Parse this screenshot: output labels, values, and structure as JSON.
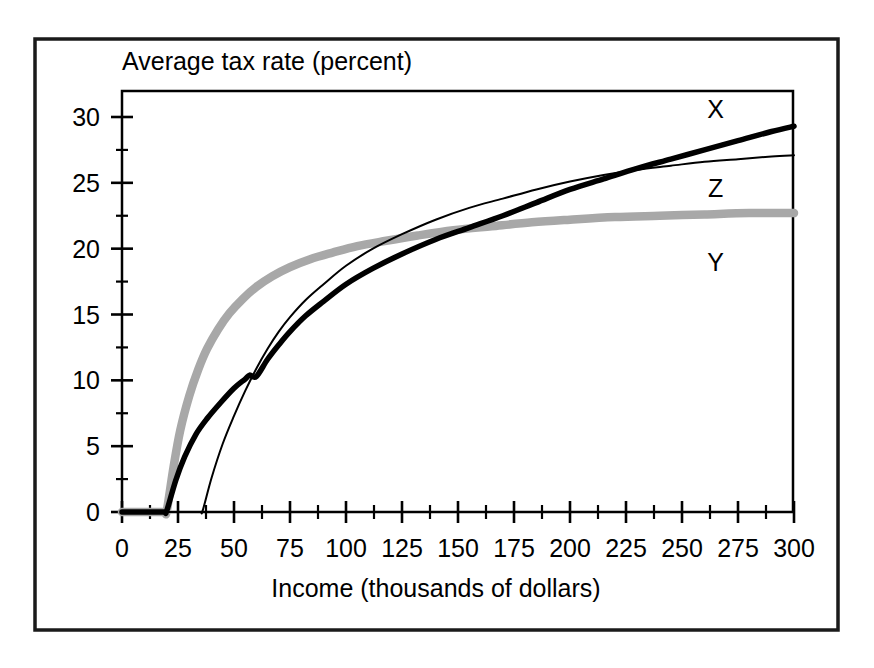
{
  "figure": {
    "frame_color": "#1a1a1a",
    "background": "#ffffff",
    "top_title": "Average tax rate (percent)",
    "bottom_title": "Income (thousands of dollars)"
  },
  "chart_data": {
    "type": "line",
    "title": "Average tax rate (percent)",
    "xlabel": "Income (thousands of dollars)",
    "ylabel": "Average tax rate (percent)",
    "xlim": [
      0,
      300
    ],
    "ylim": [
      0,
      32
    ],
    "grid": false,
    "legend": "inline-labels-right",
    "x_major_ticks": [
      0,
      25,
      50,
      75,
      100,
      125,
      150,
      175,
      200,
      225,
      250,
      275,
      300
    ],
    "x_major_tick_labels": [
      "0",
      "25",
      "50",
      "75",
      "100",
      "125",
      "150",
      "175",
      "200",
      "225",
      "250",
      "275",
      "300"
    ],
    "x_minor_tick_step": 12.5,
    "y_major_ticks": [
      0,
      5,
      10,
      15,
      20,
      25,
      30
    ],
    "y_major_tick_labels": [
      "0",
      "5",
      "10",
      "15",
      "20",
      "25",
      "30"
    ],
    "y_minor_tick_step": 2.5,
    "series": [
      {
        "name": "X",
        "label": "X",
        "color": "#000000",
        "width": 5.5,
        "label_x": 265,
        "label_y": 30.6,
        "x": [
          0,
          5,
          10,
          15,
          19,
          20,
          24,
          28,
          33,
          38,
          44,
          50,
          55,
          57,
          60,
          65,
          70,
          75,
          82,
          90,
          100,
          112,
          125,
          140,
          155,
          170,
          185,
          200,
          215,
          230,
          245,
          260,
          275,
          290,
          300
        ],
        "values": [
          0,
          0,
          0,
          0,
          0,
          0.1,
          2.4,
          4.2,
          5.9,
          7.1,
          8.3,
          9.4,
          10.1,
          10.4,
          10.3,
          11.6,
          12.7,
          13.7,
          14.9,
          16.0,
          17.3,
          18.5,
          19.6,
          20.7,
          21.6,
          22.5,
          23.5,
          24.5,
          25.3,
          26.1,
          26.8,
          27.5,
          28.2,
          28.9,
          29.3
        ]
      },
      {
        "name": "Z",
        "label": "Z",
        "color": "#000000",
        "width": 2,
        "label_x": 265,
        "label_y": 24.6,
        "x": [
          0,
          10,
          20,
          30,
          35,
          36,
          40,
          45,
          50,
          55,
          60,
          65,
          70,
          75,
          82,
          90,
          100,
          112,
          125,
          140,
          155,
          170,
          185,
          200,
          215,
          230,
          245,
          260,
          275,
          290,
          300
        ],
        "values": [
          0,
          0,
          0,
          0,
          0,
          0.1,
          2.6,
          5.2,
          7.3,
          9.2,
          10.9,
          12.4,
          13.7,
          14.8,
          16.1,
          17.3,
          18.7,
          20.0,
          21.1,
          22.2,
          23.1,
          23.8,
          24.5,
          25.1,
          25.6,
          26.0,
          26.3,
          26.6,
          26.8,
          27.0,
          27.1
        ]
      },
      {
        "name": "Y",
        "label": "Y",
        "color": "#a8a8a8",
        "width": 8.5,
        "label_x": 265,
        "label_y": 19.0,
        "x": [
          0,
          5,
          10,
          15,
          19,
          20,
          23,
          26,
          30,
          34,
          38,
          43,
          48,
          54,
          60,
          67,
          75,
          84,
          94,
          105,
          118,
          132,
          148,
          165,
          183,
          200,
          220,
          240,
          260,
          280,
          300
        ],
        "values": [
          0,
          0,
          0,
          0,
          0,
          0.1,
          3.4,
          6.2,
          8.8,
          10.8,
          12.4,
          13.9,
          15.1,
          16.2,
          17.1,
          17.9,
          18.6,
          19.2,
          19.7,
          20.2,
          20.6,
          21.0,
          21.4,
          21.7,
          22.0,
          22.2,
          22.4,
          22.5,
          22.6,
          22.7,
          22.7
        ]
      }
    ]
  }
}
